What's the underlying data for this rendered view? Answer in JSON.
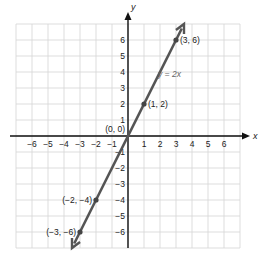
{
  "chart_data": {
    "type": "line",
    "title": "",
    "xlabel": "x",
    "ylabel": "y",
    "xlim": [
      -7,
      7
    ],
    "ylim": [
      -7,
      7
    ],
    "grid": true,
    "x_ticks": [
      -6,
      -5,
      -4,
      -3,
      -2,
      -1,
      1,
      2,
      3,
      4,
      5,
      6
    ],
    "y_ticks": [
      -6,
      -5,
      -4,
      -3,
      -2,
      -1,
      1,
      2,
      3,
      4,
      5,
      6
    ],
    "series": [
      {
        "name": "y = 2x",
        "x": [
          -3.5,
          3.5
        ],
        "y": [
          -7,
          7
        ],
        "color": "#555555"
      }
    ],
    "points": [
      {
        "x": -3,
        "y": -6,
        "label": "(−3, −6)"
      },
      {
        "x": -2,
        "y": -4,
        "label": "(−2, −4)"
      },
      {
        "x": 0,
        "y": 0,
        "label": "(0, 0)"
      },
      {
        "x": 1,
        "y": 2,
        "label": "(1, 2)"
      },
      {
        "x": 3,
        "y": 6,
        "label": "(3, 6)"
      }
    ],
    "annotations": [
      {
        "text": "y = 2x",
        "x": 2,
        "y": 3.7
      }
    ]
  },
  "labels": {
    "x_axis": "x",
    "y_axis": "y",
    "equation": "y = 2x"
  }
}
